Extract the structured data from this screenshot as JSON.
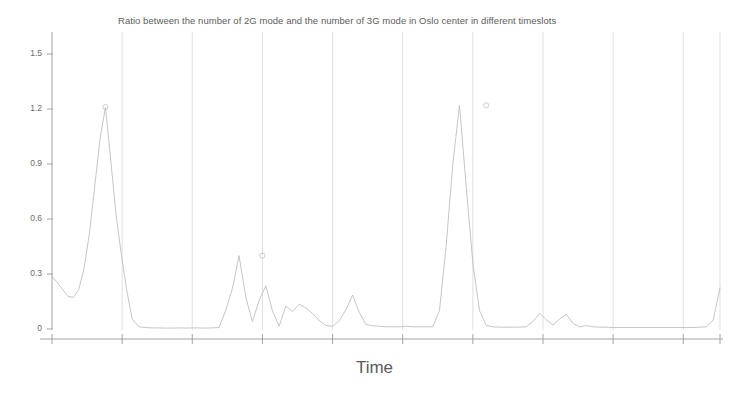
{
  "chart_data": {
    "type": "line",
    "title": "Ratio between the number of 2G mode and the number of 3G mode in Oslo center in different timeslots",
    "xlabel": "Time",
    "ylabel": "",
    "ylim": [
      0,
      1.62
    ],
    "xlim": [
      0,
      100
    ],
    "grid": "vertical-only",
    "legend": "none",
    "line_color": "#b9b9b9",
    "axis_color": "#9a9a9a",
    "grid_color": "#d2d2d2",
    "marker": "open-circle-at-peaks",
    "ytick_labels": [
      "1.5",
      "1.2",
      "0.9",
      "0.6",
      "0.3",
      "0"
    ],
    "ytick_values": [
      1.5,
      1.2,
      0.9,
      0.6,
      0.3,
      0
    ],
    "xtick_labels": [
      "",
      "",
      "",
      "",
      "",
      "",
      "",
      "",
      "",
      ""
    ],
    "xtick_values": [
      0,
      10.5,
      21,
      31.5,
      42,
      52.5,
      63,
      73.5,
      84,
      94.5
    ],
    "series": [
      {
        "name": "2G/3G ratio",
        "x": [
          0.0,
          0.8,
          1.6,
          2.4,
          3.2,
          4.0,
          4.8,
          5.6,
          6.4,
          7.2,
          8.0,
          8.8,
          9.6,
          10.4,
          11.2,
          12.0,
          13.0,
          14.0,
          15.0,
          16.0,
          17.0,
          18.0,
          19.0,
          20.0,
          21.0,
          22.0,
          23.0,
          24.0,
          25.0,
          26.0,
          27.0,
          28.0,
          29.0,
          30.0,
          31.0,
          32.0,
          33.0,
          34.0,
          35.0,
          36.0,
          37.0,
          38.0,
          39.0,
          40.0,
          41.0,
          42.0,
          43.0,
          44.0,
          45.0,
          46.0,
          47.0,
          48.0,
          49.0,
          50.0,
          51.0,
          52.0,
          53.0,
          54.0,
          55.0,
          56.0,
          57.0,
          58.0,
          59.0,
          60.0,
          61.0,
          62.0,
          63.0,
          64.0,
          65.0,
          66.0,
          67.0,
          68.0,
          69.0,
          70.0,
          71.0,
          72.0,
          73.0,
          74.0,
          75.0,
          76.0,
          77.0,
          78.0,
          79.0,
          80.0,
          81.0,
          82.0,
          83.0,
          84.0,
          85.0,
          86.0,
          87.0,
          88.0,
          89.0,
          90.0,
          91.0,
          92.0,
          93.0,
          94.0,
          95.0,
          96.0,
          97.0,
          98.0,
          99.0,
          100.0
        ],
        "y": [
          0.285,
          0.255,
          0.215,
          0.178,
          0.172,
          0.215,
          0.33,
          0.52,
          0.78,
          1.04,
          1.21,
          0.92,
          0.62,
          0.4,
          0.21,
          0.055,
          0.012,
          0.008,
          0.006,
          0.006,
          0.005,
          0.005,
          0.006,
          0.005,
          0.006,
          0.006,
          0.005,
          0.006,
          0.008,
          0.1,
          0.22,
          0.4,
          0.175,
          0.04,
          0.155,
          0.235,
          0.1,
          0.015,
          0.125,
          0.095,
          0.135,
          0.115,
          0.085,
          0.045,
          0.02,
          0.015,
          0.045,
          0.105,
          0.185,
          0.09,
          0.025,
          0.018,
          0.015,
          0.012,
          0.012,
          0.012,
          0.015,
          0.012,
          0.012,
          0.012,
          0.012,
          0.1,
          0.45,
          0.9,
          1.22,
          0.78,
          0.36,
          0.1,
          0.02,
          0.012,
          0.01,
          0.01,
          0.01,
          0.01,
          0.012,
          0.04,
          0.085,
          0.05,
          0.022,
          0.055,
          0.08,
          0.03,
          0.012,
          0.018,
          0.012,
          0.01,
          0.01,
          0.008,
          0.008,
          0.008,
          0.008,
          0.008,
          0.008,
          0.008,
          0.008,
          0.008,
          0.008,
          0.008,
          0.008,
          0.008,
          0.01,
          0.012,
          0.05,
          0.225
        ]
      }
    ],
    "annotations": [
      {
        "x": 8.0,
        "y": 1.21,
        "marker": "circle"
      },
      {
        "x": 31.5,
        "y": 0.4,
        "marker": "circle"
      },
      {
        "x": 65.0,
        "y": 1.22,
        "marker": "circle"
      }
    ]
  }
}
